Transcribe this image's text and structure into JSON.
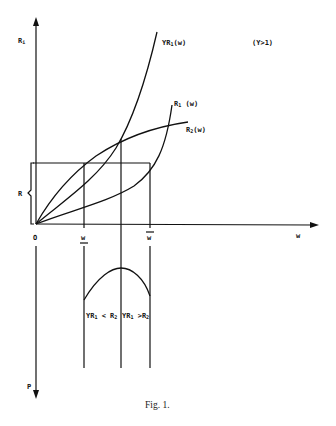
{
  "figure": {
    "caption": "Fig. 1.",
    "condition_label": "(Y>1)",
    "axes": {
      "y_axis_label": "R",
      "y_axis_sub": "i",
      "x_axis_label": "w",
      "origin_label": "O",
      "lower_axis_label": "P",
      "bracket_label": "R"
    },
    "ticks": {
      "w_lower": "w",
      "w_upper": "w"
    },
    "curves": [
      {
        "name": "YR1(w)",
        "main": "YR",
        "sub": "1",
        "tail": "(w)"
      },
      {
        "name": "R1(w)",
        "main": "R",
        "sub": "1",
        "tail": " (w)"
      },
      {
        "name": "R2(w)",
        "main": "R",
        "sub": "2",
        "tail": "(w)"
      }
    ],
    "regions": [
      {
        "main1": "YR",
        "sub1": "1",
        "op": " < R",
        "sub2": "2"
      },
      {
        "main1": "YR",
        "sub1": "1",
        "op": " >R",
        "sub2": "2"
      }
    ]
  }
}
